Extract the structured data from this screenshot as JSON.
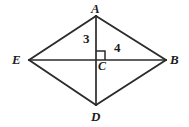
{
  "figure": {
    "shape_type": "kite",
    "background_color": "#ffffff",
    "stroke_color": "#2b2b2b",
    "text_color": "#1b1b1b",
    "vertices": [
      {
        "name": "A",
        "label": "A",
        "x": 96,
        "y": 16
      },
      {
        "name": "B",
        "label": "B",
        "x": 166,
        "y": 60
      },
      {
        "name": "D",
        "label": "D",
        "x": 96,
        "y": 105
      },
      {
        "name": "E",
        "label": "E",
        "x": 29,
        "y": 60
      },
      {
        "name": "C",
        "label": "C",
        "x": 96,
        "y": 60
      }
    ],
    "sides": [
      {
        "name": "side-EA",
        "from": "E",
        "to": "A"
      },
      {
        "name": "side-AB",
        "from": "A",
        "to": "B"
      },
      {
        "name": "side-BD",
        "from": "B",
        "to": "D"
      },
      {
        "name": "side-DE",
        "from": "D",
        "to": "E"
      }
    ],
    "diagonals": [
      {
        "name": "diagonal-AD",
        "from": "A",
        "to": "D",
        "orientation": "vertical"
      },
      {
        "name": "diagonal-EB",
        "from": "E",
        "to": "B",
        "orientation": "horizontal"
      }
    ],
    "segment_labels": [
      {
        "name": "segment-AC-length",
        "segment": "AC",
        "value": "3"
      },
      {
        "name": "segment-CB-length",
        "segment": "CB",
        "value": "4"
      }
    ],
    "right_angle": {
      "name": "right-angle-at-C",
      "at_vertex": "C",
      "quadrant": "upper-right",
      "size": 8,
      "measure": "90"
    }
  }
}
